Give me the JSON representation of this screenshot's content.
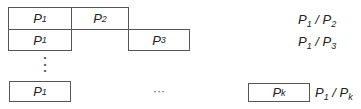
{
  "rows": [
    {
      "boxes": [
        {
          "base": "P",
          "sub": "1"
        },
        {
          "base": "P",
          "sub": "2"
        }
      ],
      "ratio": {
        "num_base": "P",
        "num_sub": "1",
        "sep": " / ",
        "den_base": "P",
        "den_sub": "2"
      }
    },
    {
      "boxes": [
        {
          "base": "P",
          "sub": "1"
        },
        {
          "base": "P",
          "sub": "3"
        }
      ],
      "ratio": {
        "num_base": "P",
        "num_sub": "1",
        "sep": " / ",
        "den_base": "P",
        "den_sub": "3"
      }
    },
    {
      "boxes": [
        {
          "base": "P",
          "sub": "1"
        },
        {
          "base": "P",
          "sub": "k"
        }
      ],
      "ratio": {
        "num_base": "P",
        "num_sub": "1",
        "sep": " / ",
        "den_base": "P",
        "den_sub": "k"
      }
    }
  ],
  "vertical_ellipsis": "⋮",
  "horizontal_ellipsis": "···"
}
